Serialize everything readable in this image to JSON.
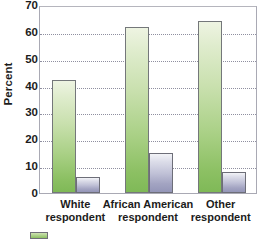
{
  "chart_data": {
    "type": "bar",
    "title": "",
    "xlabel": "",
    "ylabel": "Percent",
    "ylim": [
      0,
      70
    ],
    "yticks": [
      0,
      10,
      20,
      30,
      40,
      50,
      60,
      70
    ],
    "ytick_labels": [
      "0",
      "10",
      "20",
      "30",
      "40",
      "50",
      "60",
      "70"
    ],
    "grid": true,
    "grid_axis": "y",
    "legend_position": "bottom-left",
    "categories": [
      "White respondent",
      "African American respondent",
      "Other respondent"
    ],
    "category_lines": [
      [
        "White",
        "respondent"
      ],
      [
        "African American",
        "respondent"
      ],
      [
        "Other",
        "respondent"
      ]
    ],
    "series": [
      {
        "name": "green-series",
        "color": "#8cc063",
        "values": [
          42,
          62,
          64
        ]
      },
      {
        "name": "purple-series",
        "color": "#a3a4c2",
        "values": [
          6,
          15,
          8
        ]
      }
    ],
    "legend_entries": [
      {
        "label": "",
        "color": "#8cc063"
      }
    ]
  },
  "axis": {
    "y_title": "Percent"
  },
  "legend": {
    "swatch_name": "green-swatch",
    "text": ""
  },
  "colors": {
    "green": "#8cc063",
    "purple": "#a3a4c2",
    "frame": "#a9a9b4",
    "gridline": "#8f8fa0",
    "text": "#1c1c1c"
  }
}
